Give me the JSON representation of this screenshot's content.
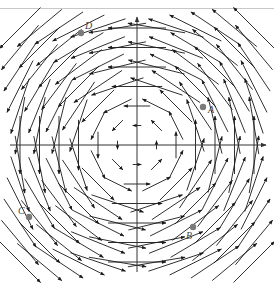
{
  "figure": {
    "type": "vector-field",
    "width": 274,
    "height": 284,
    "axes": {
      "origin_px": [
        137,
        145
      ],
      "x_axis": {
        "from_px": 10,
        "to_px": 266,
        "arrowhead": true
      },
      "y_axis": {
        "from_px": 272,
        "to_px": 17,
        "arrowhead": true
      },
      "color": "#333333"
    },
    "field": {
      "formula": "F(x, y) = (-y, x)",
      "grid_spacing_px": 19.5,
      "grid_half_count": 6,
      "arrow_color": "#1a1a1a",
      "length_scale": 0.0075,
      "length_power": 1.6,
      "max_length_px": 58,
      "min_length_px": 4
    },
    "points": [
      {
        "label": "A",
        "dot_px": [
          203,
          107
        ],
        "label_px": [
          208,
          113
        ],
        "color": "#7a7a7a"
      },
      {
        "label": "B",
        "dot_px": [
          193,
          227
        ],
        "label_px": [
          186,
          239
        ],
        "color": "#7a7a7a"
      },
      {
        "label": "C",
        "dot_px": [
          29,
          217
        ],
        "label_px": [
          18,
          214
        ],
        "color": "#7a7a7a"
      },
      {
        "label": "D",
        "dot_px": [
          81,
          33
        ],
        "label_px": [
          85,
          29
        ],
        "color": "#7a7a7a"
      }
    ]
  }
}
